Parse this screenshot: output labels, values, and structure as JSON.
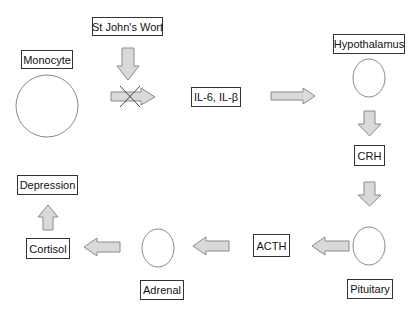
{
  "diagram": {
    "nodes": {
      "st_johns_wort": "St John's Wort",
      "monocyte": "Monocyte",
      "interleukins": "IL-6, IL-β",
      "hypothalamus": "Hypothalamus",
      "crh": "CRH",
      "pituitary": "Pituitary",
      "acth": "ACTH",
      "adrenal": "Adrenal",
      "cortisol": "Cortisol",
      "depression": "Depression"
    },
    "edges": [
      {
        "from": "St John's Wort",
        "to": "Monocyte→IL-6, IL-β arrow",
        "type": "inhibits"
      },
      {
        "from": "Monocyte",
        "to": "IL-6, IL-β",
        "type": "blocked"
      },
      {
        "from": "IL-6, IL-β",
        "to": "Hypothalamus"
      },
      {
        "from": "Hypothalamus",
        "to": "CRH"
      },
      {
        "from": "CRH",
        "to": "Pituitary"
      },
      {
        "from": "Pituitary",
        "to": "ACTH"
      },
      {
        "from": "ACTH",
        "to": "Adrenal"
      },
      {
        "from": "Adrenal",
        "to": "Cortisol"
      },
      {
        "from": "Cortisol",
        "to": "Depression"
      }
    ],
    "colors": {
      "arrow_fill": "#d9d9d9",
      "arrow_stroke": "#8a8a8a",
      "outline": "#333333"
    }
  }
}
